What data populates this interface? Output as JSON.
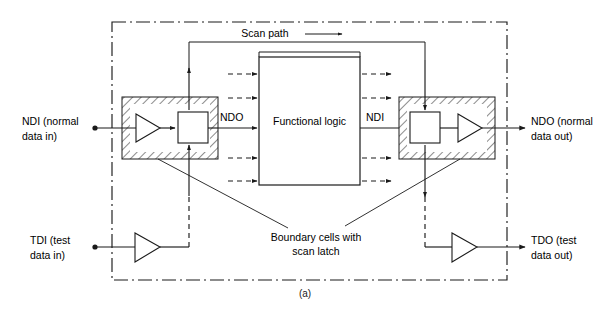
{
  "figure": {
    "caption": "(a)",
    "title_block": "Functional logic",
    "scan_path_label": "Scan path",
    "boundary_note_line1": "Boundary cells with",
    "boundary_note_line2": "scan latch"
  },
  "ports": {
    "ndi_left_line1": "NDI (normal",
    "ndi_left_line2": "data in)",
    "ndo_right_line1": "NDO (normal",
    "ndo_right_line2": "data out)",
    "tdi_line1": "TDI (test",
    "tdi_line2": "data in)",
    "tdo_line1": "TDO (test",
    "tdo_line2": "data out)"
  },
  "internal_labels": {
    "ndo_internal": "NDO",
    "ndi_internal": "NDI"
  },
  "colors": {
    "ink": "#1a1a1a",
    "paper": "#ffffff"
  },
  "signals": {
    "functional_logic_inputs": 5,
    "functional_logic_outputs": 5,
    "boundary_cells": 2
  }
}
